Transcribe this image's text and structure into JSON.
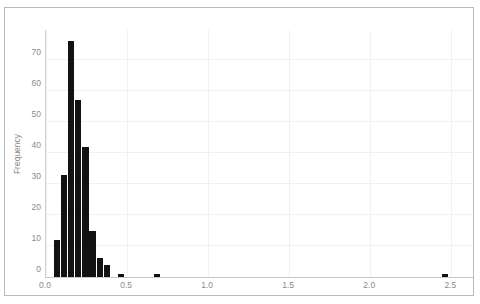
{
  "chart_data": {
    "type": "bar",
    "title": "",
    "subtitle": "",
    "xlabel": "",
    "ylabel": "Frequency",
    "xlim": [
      0.0,
      2.64
    ],
    "ylim": [
      0,
      80
    ],
    "grid": true,
    "legend": null,
    "bar_width": 0.044,
    "x_ticks": [
      "0.0",
      "0.5",
      "1.0",
      "1.5",
      "2.0",
      "2.5"
    ],
    "x_tick_values": [
      0.0,
      0.5,
      1.0,
      1.5,
      2.0,
      2.5
    ],
    "y_ticks": [
      "0",
      "10",
      "20",
      "30",
      "40",
      "50",
      "60",
      "70"
    ],
    "y_tick_values": [
      0,
      10,
      20,
      30,
      40,
      50,
      60,
      70
    ],
    "bar_color": "#121212",
    "bins": [
      {
        "x": 0.07,
        "value": 12
      },
      {
        "x": 0.114,
        "value": 33
      },
      {
        "x": 0.158,
        "value": 76
      },
      {
        "x": 0.202,
        "value": 57
      },
      {
        "x": 0.246,
        "value": 42
      },
      {
        "x": 0.29,
        "value": 15
      },
      {
        "x": 0.334,
        "value": 6
      },
      {
        "x": 0.378,
        "value": 4
      },
      {
        "x": 0.466,
        "value": 1
      },
      {
        "x": 0.686,
        "value": 1
      },
      {
        "x": 2.464,
        "value": 1
      }
    ],
    "categories": [
      0.07,
      0.114,
      0.158,
      0.202,
      0.246,
      0.29,
      0.334,
      0.378,
      0.466,
      0.686,
      2.464
    ],
    "values": [
      12,
      33,
      76,
      57,
      42,
      15,
      6,
      4,
      1,
      1,
      1
    ]
  }
}
